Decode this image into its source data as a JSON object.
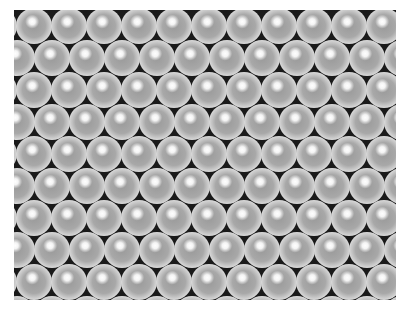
{
  "image": {
    "description": "Photograph of close-packed grey/silver spheres (pearls) in a hexagonal arrangement on a dark background",
    "rows": 9,
    "columns_per_row": 11,
    "sphere_pitch_x": 35,
    "sphere_pitch_y": 32,
    "colors": {
      "background": "#1a1a1a",
      "sphere_mid": "#a8a8a8",
      "sphere_rim": "#d8d8d8",
      "highlight": "#ffffff",
      "page": "#ffffff"
    }
  }
}
